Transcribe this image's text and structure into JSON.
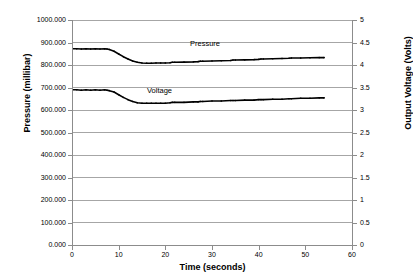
{
  "chart_data": {
    "type": "line",
    "title": "",
    "xlabel": "Time (seconds)",
    "ylabel": "Pressure (millibar)",
    "y2label": "Output Voltage (Volts)",
    "xlim": [
      0,
      60
    ],
    "ylim": [
      0,
      1000
    ],
    "y2lim": [
      0,
      5
    ],
    "grid": true,
    "legend_position": "inline-annotations",
    "xticks": [
      "0",
      "10",
      "20",
      "30",
      "40",
      "50",
      "60"
    ],
    "yticks": [
      "0.000",
      "100.000",
      "200.000",
      "300.000",
      "400.000",
      "500.000",
      "600.000",
      "700.000",
      "800.000",
      "900.000",
      "1000.000"
    ],
    "y2ticks": [
      "0",
      "0.5",
      "1",
      "1.5",
      "2",
      "2.5",
      "3",
      "3.5",
      "4",
      "4.5",
      "5"
    ],
    "line_color": "#000000",
    "gridline_color": "#A6A6A6",
    "axis_color": "#8C8C8C",
    "series": [
      {
        "name": "Pressure",
        "axis": "left",
        "units": "millibar",
        "x": [
          0,
          1,
          2,
          3,
          4,
          5,
          6,
          7,
          7.5,
          8,
          9,
          10,
          11,
          12,
          13,
          14,
          15,
          16,
          17,
          18,
          19,
          20,
          21,
          21.5,
          22,
          24,
          26,
          27,
          27.5,
          28,
          30,
          32,
          34,
          34.5,
          35,
          37,
          39,
          40,
          40.5,
          41,
          43,
          45,
          46.5,
          47,
          49,
          51,
          53,
          54
        ],
        "values": [
          872,
          872,
          871,
          872,
          871,
          872,
          871,
          872,
          871,
          869,
          861,
          849,
          837,
          827,
          818,
          812,
          809,
          808,
          808,
          809,
          809,
          809,
          810,
          812,
          812,
          813,
          814,
          815,
          817,
          817,
          818,
          819,
          820,
          822,
          822,
          823,
          824,
          825,
          827,
          827,
          828,
          829,
          830,
          831,
          831,
          832,
          833,
          833
        ]
      },
      {
        "name": "Voltage",
        "axis": "right",
        "units": "Volts",
        "x": [
          0,
          1,
          2,
          3,
          4,
          5,
          6,
          7,
          7.5,
          8,
          9,
          10,
          11,
          12,
          13,
          14,
          15,
          16,
          17,
          18,
          19,
          20,
          21,
          21.5,
          22,
          24,
          26,
          27,
          27.5,
          28,
          30,
          32,
          34,
          34.5,
          35,
          37,
          39,
          40,
          40.5,
          41,
          43,
          45,
          46.5,
          47,
          49,
          51,
          53,
          54
        ],
        "values": [
          3.45,
          3.45,
          3.44,
          3.45,
          3.44,
          3.45,
          3.44,
          3.45,
          3.44,
          3.43,
          3.4,
          3.34,
          3.28,
          3.23,
          3.19,
          3.16,
          3.15,
          3.15,
          3.15,
          3.15,
          3.15,
          3.15,
          3.16,
          3.17,
          3.17,
          3.17,
          3.18,
          3.18,
          3.19,
          3.19,
          3.2,
          3.2,
          3.21,
          3.21,
          3.21,
          3.22,
          3.22,
          3.23,
          3.23,
          3.23,
          3.24,
          3.24,
          3.25,
          3.25,
          3.26,
          3.26,
          3.27,
          3.27
        ]
      }
    ],
    "annotations": [
      {
        "text": "Pressure",
        "x": 27,
        "y": 880
      },
      {
        "text": "Voltage",
        "x": 17,
        "y": 690
      }
    ]
  }
}
